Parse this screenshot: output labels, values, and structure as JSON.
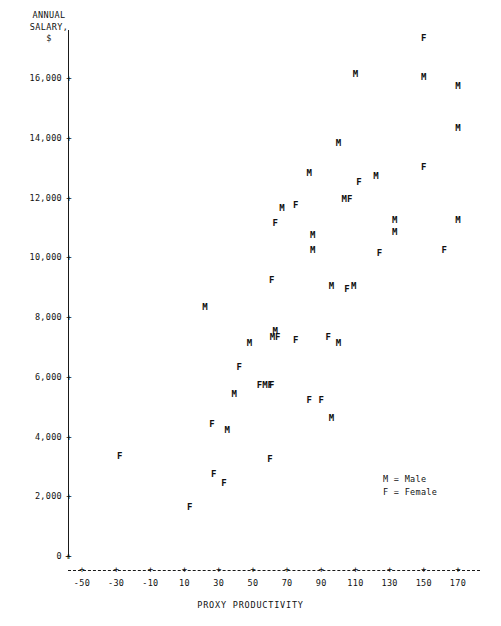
{
  "chart_data": {
    "type": "scatter",
    "title": "",
    "xlabel": "PROXY PRODUCTIVITY",
    "ylabel": "ANNUAL\nSALARY,\n$",
    "xlim": [
      -60,
      180
    ],
    "ylim": [
      0,
      18000
    ],
    "xticks": [
      -50,
      -30,
      -10,
      10,
      30,
      50,
      70,
      90,
      110,
      130,
      150,
      170
    ],
    "xticklabels": [
      "-50",
      "-30",
      "-10",
      "10",
      "30",
      "50",
      "70",
      "90",
      "110",
      "130",
      "150",
      "170"
    ],
    "yticks": [
      0,
      2000,
      4000,
      6000,
      8000,
      10000,
      12000,
      14000,
      16000
    ],
    "yticklabels": [
      "0",
      "2,000",
      "4,000",
      "6,000",
      "8,000",
      "10,000",
      "12,000",
      "14,000",
      "16,000"
    ],
    "grid": false,
    "tick_glyph": "+",
    "legend": {
      "position": "lower-right",
      "entries": [
        {
          "marker": "M",
          "label": "M = Male"
        },
        {
          "marker": "F",
          "label": "F = Female"
        }
      ]
    },
    "series": [
      {
        "name": "Male",
        "marker": "M",
        "points": [
          {
            "x": 110,
            "y": 16100
          },
          {
            "x": 150,
            "y": 16000
          },
          {
            "x": 170,
            "y": 15700
          },
          {
            "x": 170,
            "y": 14300
          },
          {
            "x": 100,
            "y": 13800
          },
          {
            "x": 83,
            "y": 12800
          },
          {
            "x": 122,
            "y": 12700
          },
          {
            "x": 105,
            "y": 11900
          },
          {
            "x": 67,
            "y": 11600
          },
          {
            "x": 133,
            "y": 11200
          },
          {
            "x": 170,
            "y": 11200
          },
          {
            "x": 133,
            "y": 10800
          },
          {
            "x": 85,
            "y": 10700
          },
          {
            "x": 85,
            "y": 10200
          },
          {
            "x": 96,
            "y": 9000
          },
          {
            "x": 109,
            "y": 9000
          },
          {
            "x": 22,
            "y": 8300
          },
          {
            "x": 63,
            "y": 7500
          },
          {
            "x": 63,
            "y": 7300
          },
          {
            "x": 48,
            "y": 7100
          },
          {
            "x": 100,
            "y": 7100
          },
          {
            "x": 39,
            "y": 5400
          },
          {
            "x": 57,
            "y": 5700
          },
          {
            "x": 35,
            "y": 4200
          },
          {
            "x": 96,
            "y": 4600
          }
        ]
      },
      {
        "name": "Female",
        "marker": "F",
        "points": [
          {
            "x": 150,
            "y": 17300
          },
          {
            "x": 150,
            "y": 13000
          },
          {
            "x": 112,
            "y": 12500
          },
          {
            "x": 105,
            "y": 11900
          },
          {
            "x": 75,
            "y": 11700
          },
          {
            "x": 63,
            "y": 11100
          },
          {
            "x": 162,
            "y": 10200
          },
          {
            "x": 124,
            "y": 10100
          },
          {
            "x": 61,
            "y": 9200
          },
          {
            "x": 105,
            "y": 8900
          },
          {
            "x": 75,
            "y": 7200
          },
          {
            "x": 94,
            "y": 7300
          },
          {
            "x": 57,
            "y": 5700
          },
          {
            "x": 61,
            "y": 5700
          },
          {
            "x": 83,
            "y": 5200
          },
          {
            "x": 90,
            "y": 5200
          },
          {
            "x": 42,
            "y": 6300
          },
          {
            "x": 26,
            "y": 4400
          },
          {
            "x": 60,
            "y": 3200
          },
          {
            "x": 27,
            "y": 2700
          },
          {
            "x": 33,
            "y": 2400
          },
          {
            "x": -28,
            "y": 3300
          },
          {
            "x": 13,
            "y": 1600
          }
        ]
      }
    ],
    "overlapping_labels": [
      {
        "x": 105,
        "y": 11900,
        "text": "MF"
      },
      {
        "x": 57,
        "y": 5700,
        "text": "FMF"
      },
      {
        "x": 63,
        "y": 7300,
        "text": "MF"
      }
    ]
  }
}
